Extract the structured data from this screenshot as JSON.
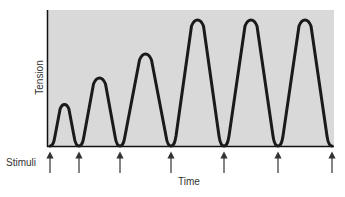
{
  "figure": {
    "y_axis_label": "Tension",
    "x_axis_label": "Time",
    "stimuli_label": "Stimuli",
    "background_color": "#d9d9d9",
    "line_color": "#1a1a1a"
  },
  "chart_data": {
    "type": "line",
    "title": "",
    "xlabel": "Time",
    "ylabel": "Tension",
    "stimuli_count": 7,
    "stimuli_x_px": [
      50,
      79,
      120,
      171,
      224,
      278,
      332
    ],
    "twitches": [
      {
        "index": 1,
        "relative_peak_tension": 0.33
      },
      {
        "index": 2,
        "relative_peak_tension": 0.54
      },
      {
        "index": 3,
        "relative_peak_tension": 0.73
      },
      {
        "index": 4,
        "relative_peak_tension": 1.0
      },
      {
        "index": 5,
        "relative_peak_tension": 1.0
      },
      {
        "index": 6,
        "relative_peak_tension": 1.0
      }
    ],
    "grid": false,
    "legend": null
  }
}
